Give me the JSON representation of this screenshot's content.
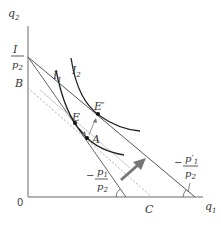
{
  "diagram": {
    "axes": {
      "y_label": "q",
      "y_sub": "2",
      "x_label": "q",
      "x_sub": "1",
      "origin": "0"
    },
    "intercept_label": {
      "num": "I",
      "den": "p",
      "den_sub": "2"
    },
    "points": {
      "B": "B",
      "C": "C",
      "E": "E",
      "E_prime": "E′",
      "A": "A"
    },
    "curves": {
      "I1": {
        "label": "I",
        "sub": "1"
      },
      "I2": {
        "label": "I",
        "sub": "2"
      }
    },
    "slopes": {
      "original": {
        "prefix": "−",
        "num": "p",
        "num_sub": "1",
        "den": "p",
        "den_sub": "2"
      },
      "new": {
        "prefix": "−",
        "num": "p′",
        "num_sub": "1",
        "den": "p",
        "den_sub": "2"
      }
    },
    "colors": {
      "axis": "#999999",
      "line": "#555555",
      "curve": "#222222",
      "dotted": "#aaaaaa",
      "arrow": "#777777",
      "point": "#111111"
    }
  }
}
